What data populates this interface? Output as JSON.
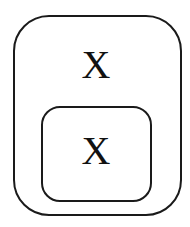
{
  "diagram": {
    "type": "nested-containers",
    "outer": {
      "label": "X"
    },
    "inner": {
      "label": "X"
    },
    "stroke_color": "#1a1a1a",
    "background": "#ffffff"
  }
}
